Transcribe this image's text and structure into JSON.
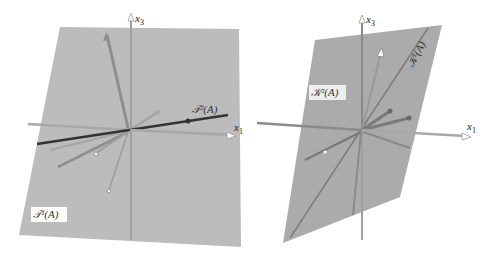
{
  "figure": {
    "left_panel": {
      "axis_labels": {
        "x1": "x",
        "x1_sub": "1",
        "x3": "x",
        "x3_sub": "3"
      },
      "plane_label": "𝒯¹(A)",
      "line_label": "𝒯²(A)",
      "plane_color": "#b9b9b9",
      "line_color": "#333333"
    },
    "right_panel": {
      "axis_labels": {
        "x1": "x",
        "x1_sub": "1",
        "x3": "x",
        "x3_sub": "3"
      },
      "plane_label": "𝒦²(A)",
      "line_label": "𝒦¹(A)",
      "plane_color": "#a9a9a9",
      "line_color": "#7a7a7a"
    }
  }
}
